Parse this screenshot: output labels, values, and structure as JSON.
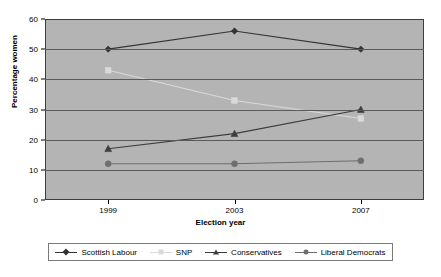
{
  "chart_data": {
    "type": "line",
    "title": "",
    "xlabel": "Election year",
    "ylabel": "Percentage women",
    "categories": [
      "1999",
      "2003",
      "2007"
    ],
    "x": [
      1999,
      2003,
      2007
    ],
    "ylim": [
      0,
      60
    ],
    "yticks": [
      0,
      10,
      20,
      30,
      40,
      50,
      60
    ],
    "ytick_labels": [
      "0",
      "10",
      "20",
      "30",
      "40",
      "50",
      "60"
    ],
    "grid": true,
    "legend_position": "bottom",
    "series": [
      {
        "name": "Scottish Labour",
        "values": [
          50,
          56,
          50
        ],
        "color": "#333333",
        "marker": "diamond"
      },
      {
        "name": "SNP",
        "values": [
          43,
          33,
          27
        ],
        "color": "#d9d9d9",
        "marker": "square"
      },
      {
        "name": "Conservatives",
        "values": [
          17,
          22,
          30
        ],
        "color": "#3d3d3d",
        "marker": "triangle"
      },
      {
        "name": "Liberal Democrats",
        "values": [
          12,
          12,
          13
        ],
        "color": "#6e6e6e",
        "marker": "circle"
      }
    ]
  },
  "colors": {
    "plot_background": "#b4b4b4",
    "gridline": "#5a5a5a",
    "axis": "#000000",
    "page_background": "#ffffff"
  }
}
